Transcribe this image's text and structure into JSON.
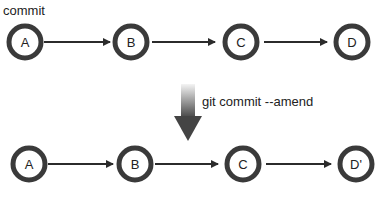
{
  "top_label": "commit",
  "command_label": "git commit --amend",
  "colors": {
    "node_stroke": "#3a3a3a",
    "edge": "#2b2b2b",
    "arrow_top": "#f2f2f2",
    "arrow_bottom": "#4a4a4a"
  },
  "top_row": {
    "nodes": [
      "A",
      "B",
      "C",
      "D"
    ]
  },
  "bottom_row": {
    "nodes": [
      "A",
      "B",
      "C",
      "D'"
    ]
  }
}
